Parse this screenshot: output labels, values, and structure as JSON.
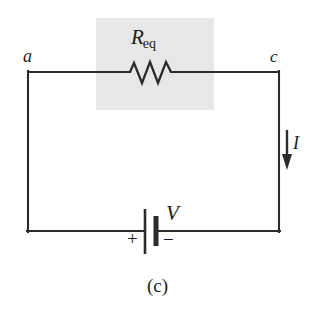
{
  "figure": {
    "caption": "(c)",
    "background_color": "#ffffff",
    "wire_color": "#2b2b2b",
    "highlight_color": "#e6e6e6"
  },
  "nodes": {
    "left_label": "a",
    "right_label": "c"
  },
  "resistor": {
    "label_main": "R",
    "label_sub": "eq",
    "icon": "resistor-zigzag-icon"
  },
  "current": {
    "label": "I",
    "icon": "down-arrow-icon",
    "direction": "down"
  },
  "battery": {
    "label": "V",
    "positive_sign": "+",
    "negative_sign": "−",
    "icon": "battery-cell-icon"
  }
}
